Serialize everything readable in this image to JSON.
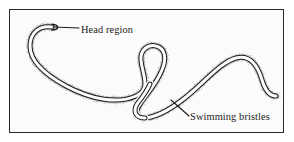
{
  "figure": {
    "kind": "scientific-illustration",
    "background_color": "#fbfbfb",
    "frame_color": "#2a2a2a",
    "ink_color": "#1c1c1c",
    "bristle_color": "#9a9a9a",
    "page_background": "#ffffff"
  },
  "labels": {
    "head_region": "Head region",
    "swimming_bristles": "Swimming bristles"
  },
  "annotations": {
    "head_leader": {
      "from_x": 53,
      "from_y": 27,
      "to_x": 79,
      "to_y": 28
    },
    "bristles_leader": {
      "from_x": 171,
      "from_y": 100,
      "to_x": 189,
      "to_y": 116
    }
  }
}
